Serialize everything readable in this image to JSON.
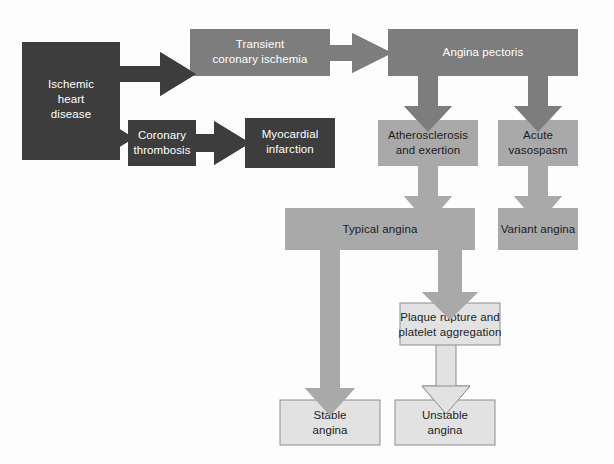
{
  "diagram": {
    "type": "flowchart",
    "canvas": {
      "width": 614,
      "height": 464,
      "background": "#fdfdfd"
    },
    "palette": {
      "dark_gray": "#3d3d3d",
      "medium_gray": "#7d7d7d",
      "light_gray": "#a9a9a9",
      "pale_gray": "#e2e2e2",
      "pale_gray_border": "#8d8d8d",
      "text_light": "#ffffff",
      "text_dark": "#1d1d1d"
    },
    "nodes": [
      {
        "id": "ischemic-heart-disease",
        "lines": [
          "Ischemic",
          "heart",
          "disease"
        ],
        "fill": "#3d3d3d",
        "text_color": "#ffffff",
        "x": 22,
        "y": 42,
        "w": 98,
        "h": 118
      },
      {
        "id": "transient-coronary-ischemia",
        "lines": [
          "Transient",
          "coronary ischemia"
        ],
        "fill": "#7d7d7d",
        "text_color": "#ffffff",
        "x": 190,
        "y": 29,
        "w": 140,
        "h": 47
      },
      {
        "id": "angina-pectoris",
        "lines": [
          "Angina pectoris"
        ],
        "fill": "#7d7d7d",
        "text_color": "#ffffff",
        "x": 388,
        "y": 29,
        "w": 190,
        "h": 47
      },
      {
        "id": "coronary-thrombosis",
        "lines": [
          "Coronary",
          "thrombosis"
        ],
        "fill": "#3d3d3d",
        "text_color": "#ffffff",
        "x": 128,
        "y": 120,
        "w": 68,
        "h": 46
      },
      {
        "id": "myocardial-infarction",
        "lines": [
          "Myocardial",
          "infarction"
        ],
        "fill": "#3d3d3d",
        "text_color": "#ffffff",
        "x": 245,
        "y": 118,
        "w": 90,
        "h": 50
      },
      {
        "id": "atherosclerosis-and-exertion",
        "lines": [
          "Atherosclerosis",
          "and exertion"
        ],
        "fill": "#a9a9a9",
        "text_color": "#1d1d1d",
        "x": 378,
        "y": 120,
        "w": 100,
        "h": 46
      },
      {
        "id": "acute-vasospasm",
        "lines": [
          "Acute",
          "vasospasm"
        ],
        "fill": "#a9a9a9",
        "text_color": "#1d1d1d",
        "x": 498,
        "y": 120,
        "w": 80,
        "h": 46
      },
      {
        "id": "typical-angina",
        "lines": [
          "Typical angina"
        ],
        "fill": "#a9a9a9",
        "text_color": "#1d1d1d",
        "x": 285,
        "y": 208,
        "w": 190,
        "h": 42
      },
      {
        "id": "variant-angina",
        "lines": [
          "Variant angina"
        ],
        "fill": "#a9a9a9",
        "text_color": "#1d1d1d",
        "x": 498,
        "y": 208,
        "w": 80,
        "h": 42
      },
      {
        "id": "plaque-rupture-platelet-aggregation",
        "lines": [
          "Plaque rupture and",
          "platelet aggregation"
        ],
        "fill": "#e2e2e2",
        "text_color": "#1d1d1d",
        "x": 400,
        "y": 303,
        "w": 100,
        "h": 42
      },
      {
        "id": "stable-angina",
        "lines": [
          "Stable",
          "angina"
        ],
        "fill": "#e2e2e2",
        "text_color": "#1d1d1d",
        "x": 280,
        "y": 400,
        "w": 100,
        "h": 45
      },
      {
        "id": "unstable-angina",
        "lines": [
          "Unstable",
          "angina"
        ],
        "fill": "#e2e2e2",
        "text_color": "#1d1d1d",
        "x": 395,
        "y": 400,
        "w": 100,
        "h": 45
      }
    ],
    "connectors": [
      {
        "id": "ihd-to-transient-ischemia",
        "from": "ischemic-heart-disease",
        "to": "transient-coronary-ischemia",
        "fill": "#3d3d3d"
      },
      {
        "id": "ihd-to-coronary-thrombosis",
        "from": "ischemic-heart-disease",
        "to": "coronary-thrombosis",
        "fill": "#3d3d3d"
      },
      {
        "id": "coronary-thrombosis-to-myocardial-infarction",
        "from": "coronary-thrombosis",
        "to": "myocardial-infarction",
        "fill": "#3d3d3d"
      },
      {
        "id": "transient-ischemia-to-angina-pectoris",
        "from": "transient-coronary-ischemia",
        "to": "angina-pectoris",
        "fill": "#7d7d7d"
      },
      {
        "id": "angina-pectoris-to-atherosclerosis",
        "from": "angina-pectoris",
        "to": "atherosclerosis-and-exertion",
        "fill": "#7d7d7d"
      },
      {
        "id": "angina-pectoris-to-acute-vasospasm",
        "from": "angina-pectoris",
        "to": "acute-vasospasm",
        "fill": "#7d7d7d"
      },
      {
        "id": "atherosclerosis-to-typical-angina",
        "from": "atherosclerosis-and-exertion",
        "to": "typical-angina",
        "fill": "#a9a9a9"
      },
      {
        "id": "acute-vasospasm-to-variant-angina",
        "from": "acute-vasospasm",
        "to": "variant-angina",
        "fill": "#a9a9a9"
      },
      {
        "id": "typical-angina-to-stable-angina",
        "from": "typical-angina",
        "to": "stable-angina",
        "fill": "#a9a9a9"
      },
      {
        "id": "typical-angina-to-plaque-rupture",
        "from": "typical-angina",
        "to": "plaque-rupture-platelet-aggregation",
        "fill": "#a9a9a9"
      },
      {
        "id": "plaque-rupture-to-unstable-angina",
        "from": "plaque-rupture-platelet-aggregation",
        "to": "unstable-angina",
        "fill": "#e2e2e2"
      }
    ]
  }
}
